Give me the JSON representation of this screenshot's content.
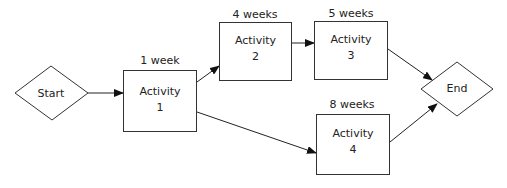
{
  "diagram": {
    "type": "activity-network",
    "nodes": {
      "start": {
        "label": "Start"
      },
      "end": {
        "label": "End"
      },
      "activity1": {
        "name": "Activity",
        "number": "1",
        "duration": "1 week"
      },
      "activity2": {
        "name": "Activity",
        "number": "2",
        "duration": "4 weeks"
      },
      "activity3": {
        "name": "Activity",
        "number": "3",
        "duration": "5 weeks"
      },
      "activity4": {
        "name": "Activity",
        "number": "4",
        "duration": "8 weeks"
      }
    },
    "edges": [
      {
        "from": "Start",
        "to": "Activity 1"
      },
      {
        "from": "Activity 1",
        "to": "Activity 2"
      },
      {
        "from": "Activity 2",
        "to": "Activity 3"
      },
      {
        "from": "Activity 3",
        "to": "End"
      },
      {
        "from": "Activity 1",
        "to": "Activity 4"
      },
      {
        "from": "Activity 4",
        "to": "End"
      }
    ],
    "colors": {
      "stroke": "#333333",
      "background": "#ffffff"
    }
  }
}
